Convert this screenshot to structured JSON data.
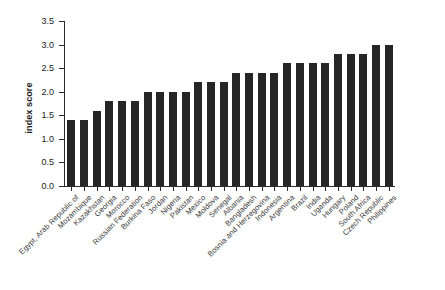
{
  "chart_data": {
    "type": "bar",
    "title": "",
    "subtitle": "",
    "xlabel": "",
    "ylabel": "index score",
    "ylim": [
      0.0,
      3.5
    ],
    "ytick_labels": [
      "0.0",
      "0.5",
      "1.0",
      "1.5",
      "2.0",
      "2.5",
      "3.0",
      "3.5"
    ],
    "ytick_values": [
      0.0,
      0.5,
      1.0,
      1.5,
      2.0,
      2.5,
      3.0,
      3.5
    ],
    "grid": false,
    "legend": false,
    "legend_position": "none",
    "bar_color": "#262626",
    "background_color": "#ffffff",
    "axis_color": "#2b2b2b",
    "categories": [
      "Egypt, Arab Republic of",
      "Mozambique",
      "Kazakhstan",
      "Georgia",
      "Morocco",
      "Russian Federation",
      "Burkina Faso",
      "Jordan",
      "Nigeria",
      "Pakistan",
      "Mexico",
      "Moldova",
      "Senegal",
      "Albania",
      "Bangladesh",
      "Bosnia and Herzegovina",
      "Indonesia",
      "Argentina",
      "Brazil",
      "India",
      "Uganda",
      "Hungary",
      "Poland",
      "South Africa",
      "Czech Republic",
      "Philippines"
    ],
    "values": [
      1.4,
      1.4,
      1.6,
      1.8,
      1.8,
      1.8,
      2.0,
      2.0,
      2.0,
      2.0,
      2.2,
      2.2,
      2.2,
      2.4,
      2.4,
      2.4,
      2.4,
      2.6,
      2.6,
      2.6,
      2.6,
      2.8,
      2.8,
      2.8,
      3.0,
      3.0
    ]
  }
}
